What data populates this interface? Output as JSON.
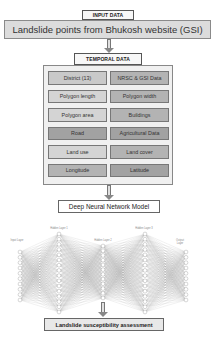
{
  "input": {
    "header": "INPUT DATA",
    "source": "Landslide points from Bhukosh website (GSI)"
  },
  "temporal": {
    "header": "TEMPORAL DATA",
    "cells": [
      {
        "label": "District (13)",
        "shade": "c1"
      },
      {
        "label": "NRSC & GSI Data",
        "shade": "c2"
      },
      {
        "label": "Polygon length",
        "shade": "c4"
      },
      {
        "label": "Polygon width",
        "shade": "c2"
      },
      {
        "label": "Polygon area",
        "shade": "c4"
      },
      {
        "label": "Buildings",
        "shade": "c2"
      },
      {
        "label": "Road",
        "shade": "c3"
      },
      {
        "label": "Agricultural Data",
        "shade": "c3"
      },
      {
        "label": "Land use",
        "shade": "c4"
      },
      {
        "label": "Land cover",
        "shade": "c2"
      },
      {
        "label": "Longitude",
        "shade": "c2"
      },
      {
        "label": "Latitude",
        "shade": "c3"
      }
    ]
  },
  "model": {
    "title": "Deep Neural Network Model",
    "layers": [
      {
        "label": "Input Layer",
        "nodes": 10
      },
      {
        "label": "Hidden Layer 1",
        "nodes": 16
      },
      {
        "label": "Hidden Layer 2",
        "nodes": 12
      },
      {
        "label": "Hidden Layer 3",
        "nodes": 16
      },
      {
        "label": "Output Layer",
        "nodes": 10
      }
    ]
  },
  "output": {
    "label": "Landslide susceptibility assessment"
  },
  "colors": {
    "panel": "#f0f0f0",
    "banner": "#dcdcdc",
    "edge": "#9a9a9a"
  }
}
